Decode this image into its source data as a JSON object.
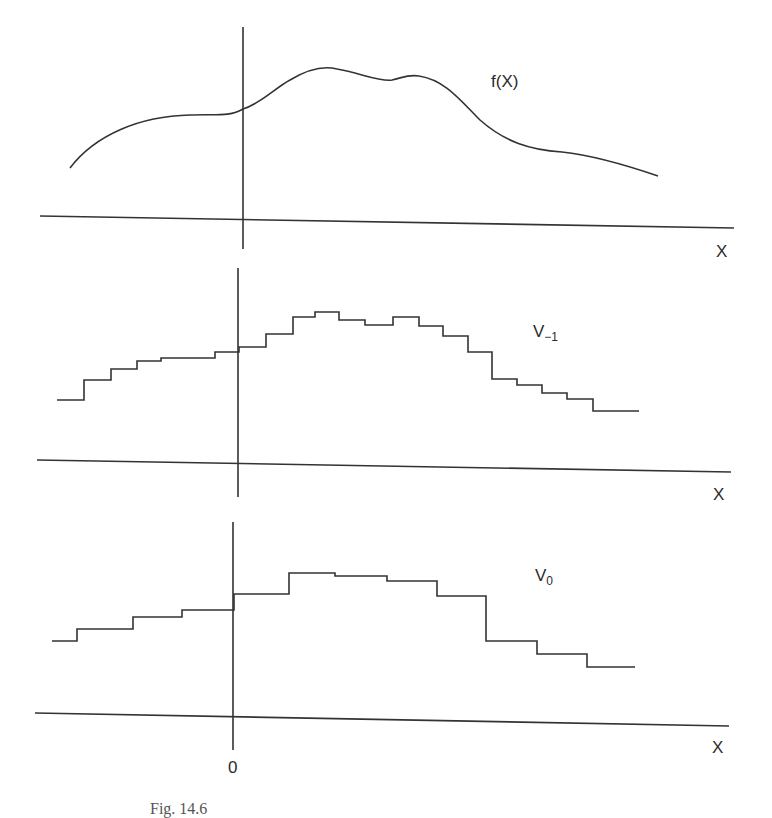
{
  "figure": {
    "caption": "Fig. 14.6",
    "panels": [
      {
        "id": "f",
        "label_main": "f(X)",
        "label_sub": "",
        "x_axis_label": "X",
        "type": "continuous"
      },
      {
        "id": "v_minus_1",
        "label_main": "V",
        "label_sub": "−1",
        "x_axis_label": "X",
        "type": "step"
      },
      {
        "id": "v_0",
        "label_main": "V",
        "label_sub": "0",
        "x_axis_label": "X",
        "origin_label": "0",
        "type": "step"
      }
    ]
  },
  "chart_data": [
    {
      "type": "line",
      "title": "f(X)",
      "xlabel": "X",
      "ylabel": "",
      "description": "Smooth continuous function with two bumps to the right of the origin",
      "points_px": [
        [
          70,
          168
        ],
        [
          130,
          128
        ],
        [
          190,
          115
        ],
        [
          243,
          109
        ],
        [
          290,
          83
        ],
        [
          337,
          69
        ],
        [
          392,
          80
        ],
        [
          419,
          76
        ],
        [
          480,
          110
        ],
        [
          562,
          152
        ],
        [
          610,
          160
        ],
        [
          658,
          176
        ]
      ]
    },
    {
      "type": "line",
      "title": "V_{-1}",
      "xlabel": "X",
      "description": "Piecewise-constant (fine scale) approximation of f",
      "steps_px": [
        [
          57,
          400
        ],
        [
          84,
          380
        ],
        [
          111,
          369
        ],
        [
          137,
          361
        ],
        [
          161,
          358
        ],
        [
          215,
          352
        ],
        [
          239,
          347
        ],
        [
          266,
          334
        ],
        [
          293,
          317
        ],
        [
          315,
          312
        ],
        [
          339,
          320
        ],
        [
          365,
          325
        ],
        [
          393,
          317
        ],
        [
          419,
          326
        ],
        [
          443,
          336
        ],
        [
          468,
          352
        ],
        [
          492,
          379
        ],
        [
          517,
          385
        ],
        [
          542,
          393
        ],
        [
          567,
          399
        ],
        [
          593,
          411
        ],
        [
          639,
          411
        ]
      ]
    },
    {
      "type": "line",
      "title": "V_0",
      "xlabel": "X",
      "description": "Piecewise-constant (coarse scale) approximation of f",
      "steps_px": [
        [
          52,
          641
        ],
        [
          77,
          629
        ],
        [
          133,
          617
        ],
        [
          182,
          610
        ],
        [
          234,
          594
        ],
        [
          289,
          573
        ],
        [
          335,
          576
        ],
        [
          387,
          581
        ],
        [
          437,
          596
        ],
        [
          486,
          641
        ],
        [
          537,
          654
        ],
        [
          587,
          667
        ],
        [
          635,
          667
        ]
      ]
    }
  ]
}
